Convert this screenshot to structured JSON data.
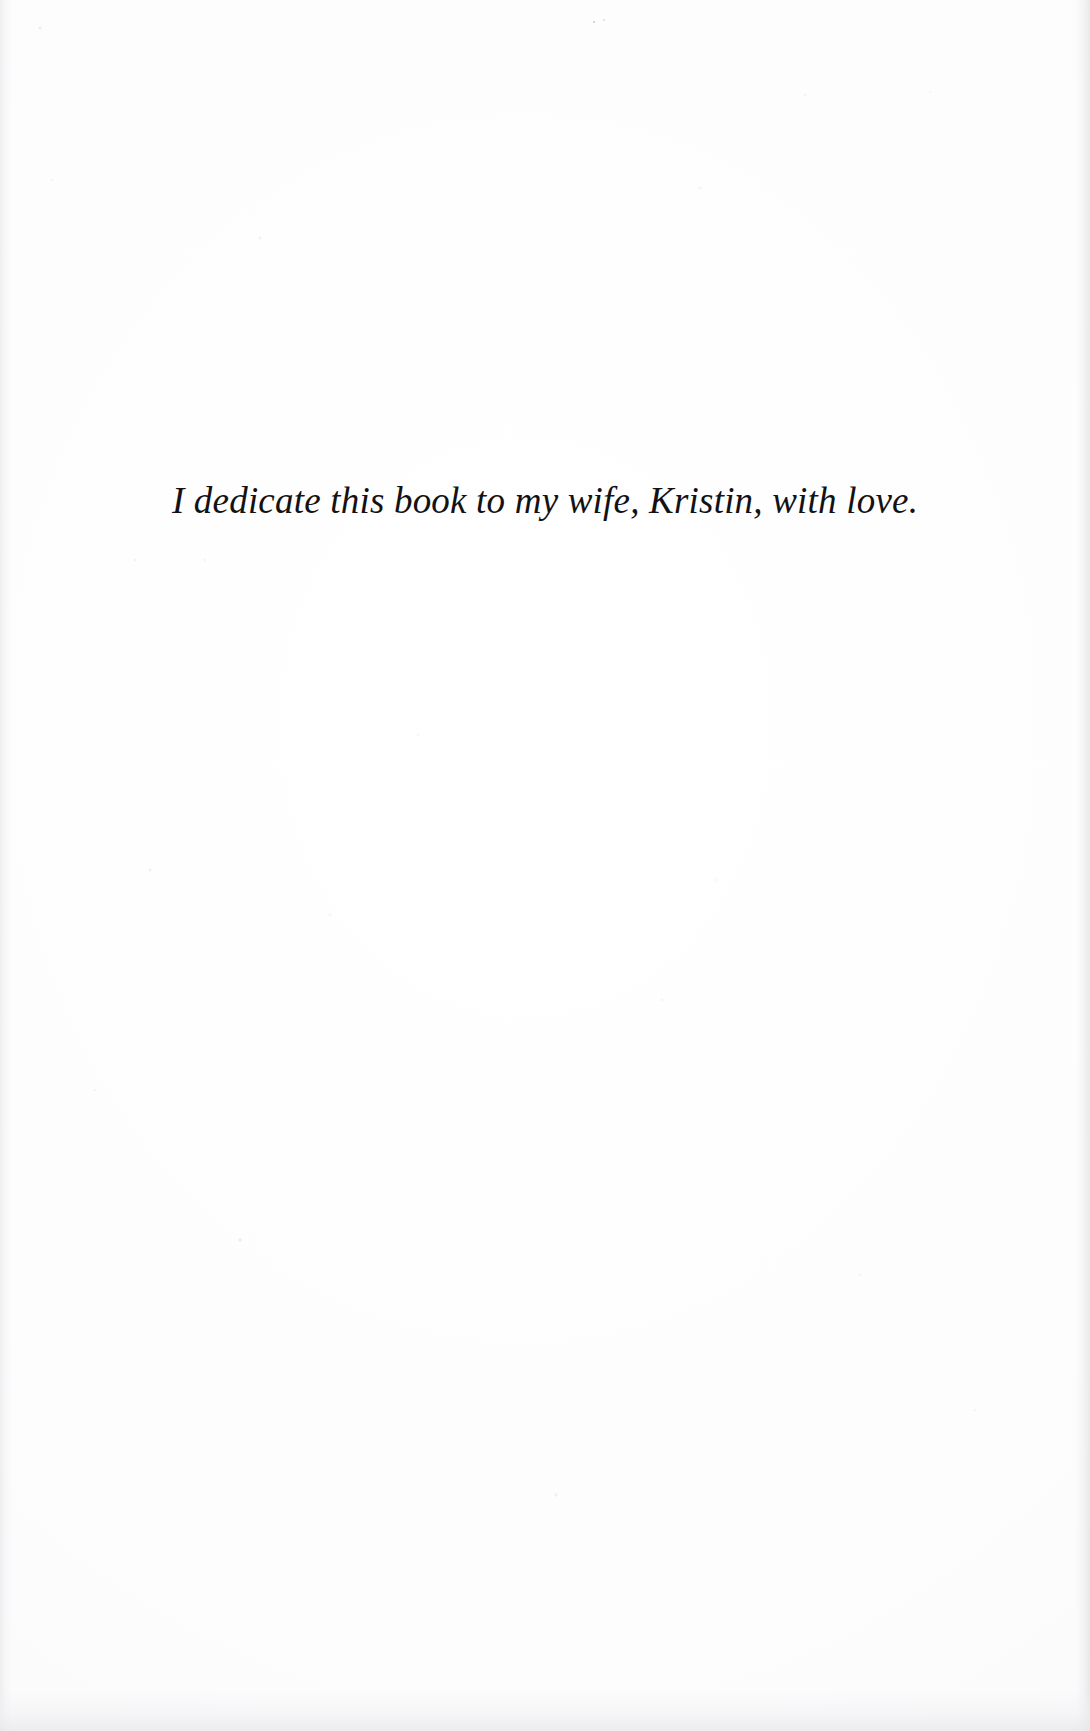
{
  "page": {
    "kind": "book-dedication-page",
    "background_color": "#fdfdfd",
    "text_color": "#121214",
    "width_px": 1090,
    "height_px": 1731
  },
  "dedication": {
    "text": "I dedicate this book to my wife, Kristin, with love.",
    "style": "italic",
    "alignment": "center"
  }
}
